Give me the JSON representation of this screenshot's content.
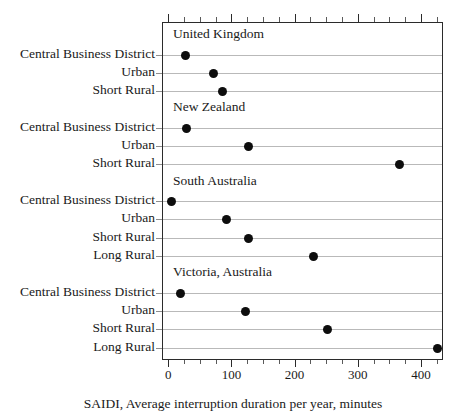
{
  "chart_data": {
    "type": "scatter",
    "subtype": "dot-plot",
    "title": "",
    "xlabel": "SAIDI, Average interruption duration per year, minutes",
    "ylabel": "",
    "xlim": [
      -10,
      435
    ],
    "xticks": [
      0,
      100,
      200,
      300,
      400
    ],
    "xtick_labels": [
      "0",
      "100",
      "200",
      "300",
      "400"
    ],
    "minor_tick_interval": 25,
    "grid": "horizontal-row-rules",
    "legend": "none",
    "groups": [
      {
        "name": "United Kingdom",
        "categories": [
          "Central Business District",
          "Urban",
          "Short Rural"
        ],
        "values": [
          25,
          70,
          85
        ]
      },
      {
        "name": "New Zealand",
        "categories": [
          "Central Business District",
          "Urban",
          "Short Rural"
        ],
        "values": [
          27,
          125,
          365
        ]
      },
      {
        "name": "South Australia",
        "categories": [
          "Central Business District",
          "Urban",
          "Short Rural",
          "Long Rural"
        ],
        "values": [
          3,
          90,
          125,
          228
        ]
      },
      {
        "name": "Victoria, Australia",
        "categories": [
          "Central Business District",
          "Urban",
          "Short Rural",
          "Long Rural"
        ],
        "values": [
          18,
          120,
          250,
          425
        ]
      }
    ],
    "marker": {
      "shape": "circle",
      "color": "#0d0d0d",
      "size_px": 9
    },
    "colors": {
      "frame": "#2b2b2b",
      "row_rule": "#b9b9b9",
      "text": "#1a1a1a",
      "background": "#ffffff"
    }
  }
}
